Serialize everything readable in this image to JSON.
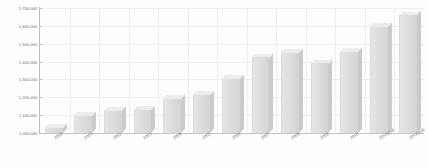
{
  "chart_data": {
    "type": "bar",
    "title": "",
    "subtitle": "",
    "xlabel": "",
    "ylabel": "",
    "grid": true,
    "legend": "none",
    "ylim": [
      1000000,
      1700000
    ],
    "ytick_labels": [
      "1,700,000",
      "1,600,000",
      "1,500,000",
      "1,400,000",
      "1,300,000",
      "1,200,000",
      "1,100,000",
      "1,000,000"
    ],
    "ytick_values": [
      1700000,
      1600000,
      1500000,
      1400000,
      1300000,
      1200000,
      1100000,
      1000000
    ],
    "categories": [
      "2000",
      "2001",
      "2002",
      "2003",
      "2004",
      "2005",
      "2006",
      "2007",
      "2008",
      "2009",
      "2010",
      "2011(est)",
      "2012(est)"
    ],
    "values": [
      1030000,
      1095000,
      1125000,
      1130000,
      1190000,
      1215000,
      1305000,
      1425000,
      1450000,
      1390000,
      1455000,
      1595000,
      1660000
    ],
    "series": [
      {
        "name": "Value",
        "values": [
          1030000,
          1095000,
          1125000,
          1130000,
          1190000,
          1215000,
          1305000,
          1425000,
          1450000,
          1390000,
          1455000,
          1595000,
          1660000
        ]
      }
    ],
    "colors": {
      "bar_face": "#dcdddd",
      "bar_top": "#ececec",
      "bar_side": "#c9caca",
      "gridline": "#eceff1",
      "axis": "#b9bdc0",
      "tick_label": "#6d7275",
      "background": "#fefefe"
    }
  }
}
